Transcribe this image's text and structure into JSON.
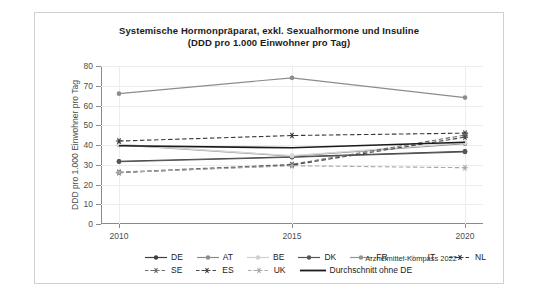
{
  "chart_data": {
    "type": "line",
    "title": "Systemische Hormonpräparat, exkl. Sexualhormone und Insuline",
    "subtitle": "(DDD pro 1.000 Einwohner pro Tag)",
    "xlabel": "",
    "ylabel": "DDD pro 1.000 Einwohner pro Tag",
    "x": [
      "2010",
      "2015",
      "2020"
    ],
    "categories": [
      "2010",
      "2015",
      "2020"
    ],
    "xticklabels": [
      "2010",
      "2015",
      "2020"
    ],
    "yticklabels": [
      "0",
      "10",
      "20",
      "30",
      "40",
      "50",
      "60",
      "70",
      "80"
    ],
    "yticks": [
      0,
      10,
      20,
      30,
      40,
      50,
      60,
      70,
      80
    ],
    "ylim": [
      0,
      80
    ],
    "grid": "horizontal-and-vertical-light",
    "legend_position": "bottom",
    "series": [
      {
        "name": "DE",
        "values": [
          31.8,
          34.0,
          36.8
        ],
        "color": "#404040",
        "style": "solid",
        "marker": "circle"
      },
      {
        "name": "AT",
        "values": [
          66.0,
          74.0,
          64.0
        ],
        "color": "#8c8c8c",
        "style": "solid",
        "marker": "circle"
      },
      {
        "name": "BE",
        "values": [
          40.5,
          34.5,
          41.0
        ],
        "color": "#cfcfcf",
        "style": "solid",
        "marker": "circle"
      },
      {
        "name": "DK",
        "values": [
          31.5,
          33.8,
          36.5
        ],
        "color": "#555555",
        "style": "solid",
        "marker": "circle"
      },
      {
        "name": "FR",
        "values": [
          40.0,
          34.3,
          40.6
        ],
        "color": "#949494",
        "style": "solid",
        "marker": "circle"
      },
      {
        "name": "IT",
        "values": [
          40.2,
          34.6,
          41.2
        ],
        "color": "#d8d8d8",
        "style": "solid",
        "marker": "circle"
      },
      {
        "name": "NL",
        "values": [
          42.0,
          44.8,
          46.0
        ],
        "color": "#3a3a3a",
        "style": "dashed",
        "marker": "star"
      },
      {
        "name": "SE",
        "values": [
          26.2,
          30.2,
          45.0
        ],
        "color": "#6e6e6e",
        "style": "dashed",
        "marker": "star"
      },
      {
        "name": "ES",
        "values": [
          26.0,
          29.8,
          44.0
        ],
        "color": "#4a4a4a",
        "style": "dashed",
        "marker": "star"
      },
      {
        "name": "UK",
        "values": [
          26.1,
          29.5,
          28.5
        ],
        "color": "#a8a8a8",
        "style": "dashed",
        "marker": "star"
      },
      {
        "name": "Durchschnitt ohne DE",
        "values": [
          39.6,
          38.6,
          41.4
        ],
        "color": "#1a1a1a",
        "style": "solid",
        "marker": "none"
      }
    ]
  },
  "title": {
    "line1": "Systemische Hormonpräparat, exkl. Sexualhormone und Insuline",
    "line2": "(DDD pro 1.000 Einwohner pro Tag)"
  },
  "axes": {
    "y_title": "DDD pro 1.000 Einwohner pro Tag",
    "y_labels": [
      "80",
      "70",
      "60",
      "50",
      "40",
      "30",
      "20",
      "10",
      "0"
    ],
    "x_labels": [
      "2010",
      "2015",
      "2020"
    ]
  },
  "legend": {
    "row1": [
      {
        "label": "DE"
      },
      {
        "label": "AT"
      },
      {
        "label": "BE"
      },
      {
        "label": "DK"
      },
      {
        "label": "FR"
      },
      {
        "label": "IT"
      },
      {
        "label": "NL"
      }
    ],
    "row2": [
      {
        "label": "SE"
      },
      {
        "label": "ES"
      },
      {
        "label": "UK"
      },
      {
        "label": "Durchschnitt ohne DE"
      }
    ]
  },
  "credit": "Arzneimittel-Kompass 2022"
}
